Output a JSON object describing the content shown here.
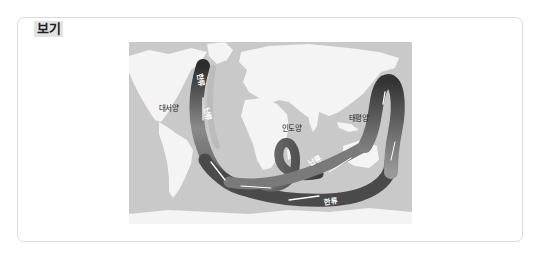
{
  "box": {
    "label": "보기"
  },
  "figure": {
    "ocean_labels": {
      "atlantic": "대서양",
      "indian": "인도양",
      "pacific": "태평양"
    },
    "current_labels": {
      "cold_north_atlantic": "한류",
      "warm_atlantic": "난류",
      "warm_indo_pacific": "난류",
      "cold_southern": "한류"
    },
    "colors": {
      "ocean": "#c9c9c9",
      "land": "#f4f4f4",
      "current_dark": "#3a3a3a",
      "current_mid": "#6e6e6e",
      "current_light": "#9a9a9a"
    }
  }
}
